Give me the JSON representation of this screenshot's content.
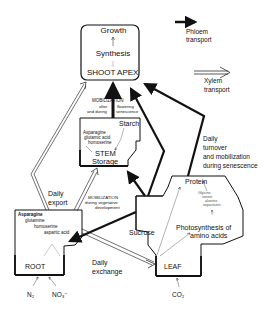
{
  "legend": {
    "phloem": {
      "line1": "Phloem",
      "line2": "transport"
    },
    "xylem": {
      "line1": "Xylem",
      "line2": "transport"
    }
  },
  "shoot_apex": {
    "growth": "Growth",
    "synthesis": "Synthesis",
    "label": "SHOOT  APEX"
  },
  "mobilization_top": {
    "title": "MOBILIZATION",
    "left": "after\nand during",
    "right": "flowering\nsenescence",
    "left1": "after",
    "left2": "and during",
    "right1": "flowering",
    "right2": "senescence"
  },
  "stem": {
    "starch": "Starch",
    "aa1": "Asparagine",
    "aa2": "glutamic acid",
    "aa3": "homoserine",
    "label1": "STEM",
    "label2": "Storage"
  },
  "daily_export": {
    "line1": "Daily",
    "line2": "export"
  },
  "mobilization_mid": {
    "title": "MOBILIZATION",
    "line2": "during  vegetative",
    "line3": "development"
  },
  "daily_turnover": {
    "line1": "Daily",
    "line2": "turnover",
    "line3": "and mobilization",
    "line4": "during senescence"
  },
  "leaf": {
    "protein": "Protein",
    "aa1": "Glycine",
    "aa2": "serine",
    "aa3": "alanine",
    "aa4": "aspartates",
    "photo1": "Photosynthesis of",
    "photo2": "amino acids",
    "label": "LEAF",
    "input": "CO₂"
  },
  "sucrose": "Sucrose",
  "root": {
    "aa1": "Asparagine",
    "aa2": "glutamine",
    "aa3": "homoserine",
    "aa4": "aspartic acid",
    "label": "ROOT",
    "input1": "N₂",
    "input2": "NO₃⁻"
  },
  "daily_exchange": {
    "line1": "Daily",
    "line2": "exchange"
  }
}
